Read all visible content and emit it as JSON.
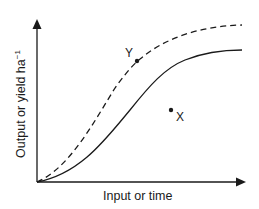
{
  "diagram": {
    "x_axis_label": "Input or time",
    "y_axis_label": "Output or yield ha",
    "y_axis_label_superscript": "−1",
    "points": [
      {
        "id": "Y",
        "label": "Y"
      },
      {
        "id": "X",
        "label": "X"
      }
    ],
    "curves": [
      {
        "name": "potential",
        "style": "dashed"
      },
      {
        "name": "actual",
        "style": "solid"
      }
    ],
    "colors": {
      "line": "#1a1a1a",
      "background": "#ffffff"
    }
  }
}
